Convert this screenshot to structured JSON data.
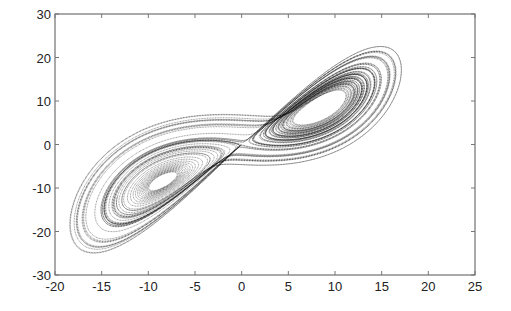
{
  "chart_data": {
    "type": "scatter",
    "title": "",
    "xlabel": "",
    "ylabel": "",
    "xlim": [
      -20,
      25
    ],
    "ylim": [
      -30,
      30
    ],
    "x_ticks": [
      -20,
      -15,
      -10,
      -5,
      0,
      5,
      10,
      15,
      20,
      25
    ],
    "y_ticks": [
      -30,
      -20,
      -10,
      0,
      10,
      20,
      30
    ],
    "grid": false,
    "legend": null,
    "series": [
      {
        "name": "trajectory",
        "model": "lorenz",
        "params": {
          "sigma": 10,
          "rho": 28,
          "beta": 2.6667
        },
        "initial": [
          1,
          1,
          1
        ],
        "dt": 0.005,
        "steps": 16000,
        "x_range_approx": [
          -17.5,
          19
        ],
        "y_range_approx": [
          -22,
          25
        ],
        "color": "#000000"
      }
    ]
  },
  "layout": {
    "plot_left": 55,
    "plot_right": 475,
    "plot_top": 14,
    "plot_bottom": 275
  }
}
